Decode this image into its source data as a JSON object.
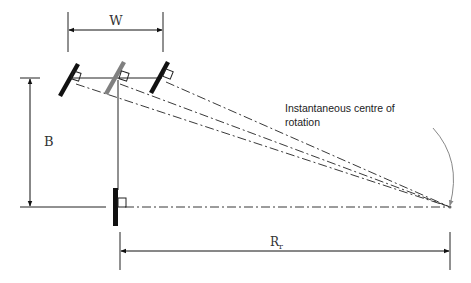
{
  "diagram": {
    "type": "vehicle-steering-geometry",
    "labels": {
      "track_width": "W",
      "wheelbase": "B",
      "turn_radius_main": "R",
      "turn_radius_sub": "r",
      "icr_line1": "Instantaneous centre of",
      "icr_line2": "rotation"
    },
    "elements": {
      "front_wheels": [
        "outer-left-wheel",
        "virtual-centre-wheel",
        "inner-right-wheel"
      ],
      "rear_wheel": "rear-wheel",
      "instantaneous_centre": "icr-point"
    },
    "colors": {
      "wheel": "#111111",
      "virtual_wheel": "#808080",
      "lines": "#222222",
      "arrow": "#888888"
    }
  }
}
